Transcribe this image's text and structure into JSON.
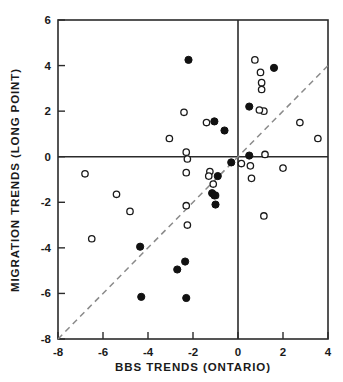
{
  "chart_data": {
    "type": "scatter",
    "title": "",
    "xlabel": "BBS  TRENDS  (ONTARIO)",
    "ylabel": "MIGRATION  TRENDS (LONG POINT)",
    "xlim": [
      -8,
      4
    ],
    "ylim": [
      -8,
      6
    ],
    "xticks": [
      -8,
      -6,
      -4,
      -2,
      0,
      2,
      4
    ],
    "xticklabels": [
      "-8",
      "-6",
      "-4",
      "-2",
      "0",
      "2",
      "4"
    ],
    "yticks": [
      -8,
      -6,
      -4,
      -2,
      0,
      2,
      4,
      6
    ],
    "yticklabels": [
      "-8",
      "-6",
      "-4",
      "-2",
      "0",
      "2",
      "4",
      "6"
    ],
    "grid": false,
    "legend": "none",
    "annotations": [
      {
        "name": "reference-line",
        "type": "dashed-line",
        "equation": "y = x",
        "from": [
          -8,
          -8
        ],
        "to": [
          4,
          4
        ]
      },
      {
        "name": "zero-vertical",
        "type": "solid-line",
        "x": 0
      },
      {
        "name": "zero-horizontal",
        "type": "solid-line",
        "y": 0
      }
    ],
    "series": [
      {
        "name": "open-circles",
        "marker": "open-circle",
        "color": "#ffffff",
        "edgecolor": "#1a1a1a",
        "points": [
          [
            -6.8,
            -0.75
          ],
          [
            -6.5,
            -3.6
          ],
          [
            -5.4,
            -1.65
          ],
          [
            -4.8,
            -2.4
          ],
          [
            -3.05,
            0.8
          ],
          [
            -2.4,
            1.95
          ],
          [
            -2.3,
            0.2
          ],
          [
            -2.25,
            -0.1
          ],
          [
            -2.3,
            -0.7
          ],
          [
            -2.3,
            -2.15
          ],
          [
            -2.25,
            -3.0
          ],
          [
            -1.4,
            1.5
          ],
          [
            -1.25,
            -0.65
          ],
          [
            -1.3,
            -0.85
          ],
          [
            -1.1,
            -1.2
          ],
          [
            -1.0,
            -1.7
          ],
          [
            0.15,
            -0.3
          ],
          [
            0.55,
            -0.4
          ],
          [
            0.6,
            -0.95
          ],
          [
            0.75,
            4.25
          ],
          [
            1.05,
            3.25
          ],
          [
            1.05,
            2.95
          ],
          [
            1.0,
            3.7
          ],
          [
            1.15,
            2.0
          ],
          [
            0.95,
            2.05
          ],
          [
            1.2,
            0.1
          ],
          [
            1.15,
            -2.6
          ],
          [
            2.0,
            -0.5
          ],
          [
            2.75,
            1.5
          ],
          [
            3.55,
            0.8
          ]
        ]
      },
      {
        "name": "filled-circles",
        "marker": "filled-circle",
        "color": "#111111",
        "points": [
          [
            -2.2,
            4.25
          ],
          [
            -1.05,
            1.55
          ],
          [
            -0.6,
            1.15
          ],
          [
            -0.3,
            -0.25
          ],
          [
            -0.9,
            -0.85
          ],
          [
            -1.15,
            -1.6
          ],
          [
            -1.05,
            -1.7
          ],
          [
            -1.0,
            -2.1
          ],
          [
            -4.35,
            -3.95
          ],
          [
            -4.3,
            -6.15
          ],
          [
            -2.7,
            -4.95
          ],
          [
            -2.35,
            -4.6
          ],
          [
            -2.3,
            -6.2
          ],
          [
            0.5,
            0.05
          ],
          [
            0.5,
            2.2
          ],
          [
            1.6,
            3.9
          ]
        ]
      }
    ]
  }
}
